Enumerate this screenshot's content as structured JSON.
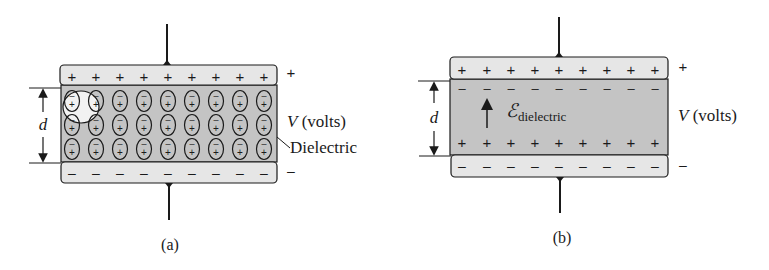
{
  "colors": {
    "plate_fill": "#e6e6e6",
    "dielectric_fill": "#c4c4c4",
    "stroke": "#1a1a1a",
    "highlight": "#f2f2f2"
  },
  "panel_a": {
    "caption": "(a)",
    "top_plate_sign": "+",
    "bottom_plate_sign": "–",
    "top_plate_charges": [
      "+",
      "+",
      "+",
      "+",
      "+",
      "+",
      "+",
      "+",
      "+"
    ],
    "bottom_plate_charges": [
      "–",
      "–",
      "–",
      "–",
      "–",
      "–",
      "–",
      "–",
      "–"
    ],
    "dipole_rows": 3,
    "dipole_cols": 9,
    "dipole_top_sign": "–",
    "dipole_bottom_sign": "+",
    "distance_label": "d",
    "voltage_label_italic": "V",
    "voltage_label_unit": " (volts)",
    "dielectric_label": "Dielectric"
  },
  "panel_b": {
    "caption": "(b)",
    "top_plate_sign": "+",
    "bottom_plate_sign": "–",
    "top_plate_charges": [
      "+",
      "+",
      "+",
      "+",
      "+",
      "+",
      "+",
      "+",
      "+"
    ],
    "bottom_plate_charges": [
      "–",
      "–",
      "–",
      "–",
      "–",
      "–",
      "–",
      "–",
      "–"
    ],
    "induced_top_charges": [
      "–",
      "–",
      "–",
      "–",
      "–",
      "–",
      "–",
      "–",
      "–"
    ],
    "induced_bottom_charges": [
      "+",
      "+",
      "+",
      "+",
      "+",
      "+",
      "+",
      "+",
      "+"
    ],
    "distance_label": "d",
    "field_symbol": "ℰ",
    "field_subscript": "dielectric",
    "voltage_label_italic": "V",
    "voltage_label_unit": " (volts)"
  }
}
